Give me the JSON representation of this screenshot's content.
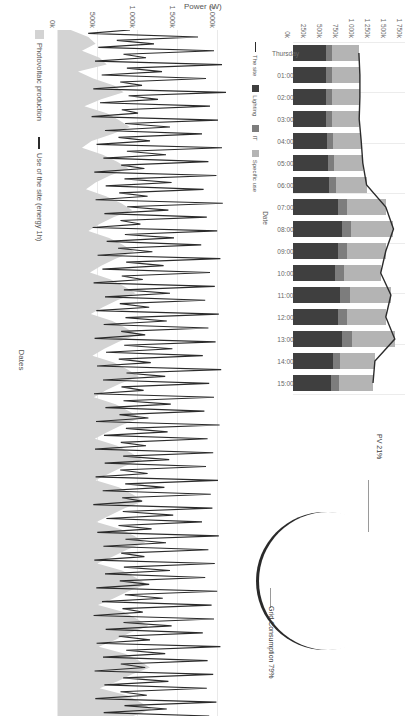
{
  "charts": {
    "timeseries": {
      "title": "",
      "ylabel": "Power (W)",
      "xlabel": "Dates",
      "yticks": [
        "0k",
        "500k",
        "1 000k",
        "1 500k",
        "2 000k"
      ],
      "legend": [
        {
          "label": "Photovoltaic production",
          "marker": "area-swatch",
          "color": "#d3d3d3"
        },
        {
          "label": "Use of the site (energy 1h)",
          "marker": "line-swatch",
          "color": "#2b2b2b"
        }
      ]
    },
    "stacked_bars": {
      "ylabel": "",
      "xlabel": "Date",
      "yticks": [
        "0k",
        "250k",
        "500k",
        "750k",
        "1 000k",
        "1 250k",
        "1 500k",
        "1 750k"
      ],
      "xticks": [
        "Thursday",
        "01:00",
        "02:00",
        "03:00",
        "04:00",
        "05:00",
        "06:00",
        "07:00",
        "08:00",
        "09:00",
        "10:00",
        "11:00",
        "12:00",
        "13:00",
        "14:00",
        "15:00"
      ],
      "legend": [
        {
          "label": "The site",
          "marker": "line-swatch",
          "color": "#2b2b2b"
        },
        {
          "label": "Lighting",
          "marker": "box-swatch",
          "color": "#3f3f3f"
        },
        {
          "label": "IT",
          "marker": "box-swatch",
          "color": "#7d7d7d"
        },
        {
          "label": "Specific use",
          "marker": "box-swatch",
          "color": "#b4b4b4"
        }
      ]
    },
    "pie": {
      "labels": [
        "PV 21%",
        "Grid Consumption 79%"
      ],
      "slices": [
        {
          "name": "PV 21%",
          "value": 21,
          "color": "#ececec"
        },
        {
          "name": "Grid Consumption 79%",
          "value": 79,
          "color": "#3a3a3a"
        }
      ]
    }
  },
  "chart_data": [
    {
      "type": "area",
      "title": "",
      "xlabel": "Dates",
      "ylabel": "Power (W)",
      "ylim": [
        0,
        2200000
      ],
      "yticks": [
        0,
        500000,
        1000000,
        1500000,
        2000000
      ],
      "ytick_labels": [
        "0k",
        "500k",
        "1 000k",
        "1 500k",
        "2 000k"
      ],
      "grid": true,
      "legend_position": "bottom-left",
      "series": [
        {
          "name": "Photovoltaic production",
          "color": "#d3d3d3",
          "kind": "area",
          "values": [
            160000,
            380000,
            470000,
            300000,
            520000,
            610000,
            250000,
            440000,
            700000,
            820000,
            540000,
            330000,
            610000,
            760000,
            900000,
            680000,
            420000,
            300000,
            560000,
            740000,
            880000,
            650000,
            470000,
            350000,
            600000,
            790000,
            930000,
            700000,
            520000,
            380000,
            640000,
            810000,
            950000,
            720000,
            540000,
            400000,
            660000,
            830000,
            970000,
            740000,
            560000,
            410000,
            680000,
            850000,
            990000,
            760000,
            580000,
            430000,
            700000,
            870000,
            1010000,
            780000,
            600000,
            450000,
            720000,
            890000,
            1030000,
            800000,
            620000,
            460000,
            740000,
            910000,
            1050000,
            820000,
            640000,
            470000,
            760000,
            930000,
            1070000,
            840000,
            660000,
            480000,
            780000,
            950000,
            1090000,
            860000,
            680000,
            490000,
            800000,
            970000,
            1110000,
            880000,
            700000,
            500000,
            820000,
            990000,
            1130000,
            900000,
            720000,
            510000,
            840000,
            1010000,
            1150000,
            920000,
            740000,
            520000,
            860000,
            1030000,
            1170000,
            940000
          ]
        },
        {
          "name": "Use of the site (energy 1h)",
          "color": "#2b2b2b",
          "kind": "line",
          "values": [
            900000,
            1750000,
            1200000,
            1950000,
            1100000,
            2050000,
            1300000,
            1850000,
            1050000,
            2100000,
            1250000,
            1900000,
            1000000,
            2000000,
            1400000,
            1800000,
            1150000,
            2050000,
            1350000,
            1880000,
            1080000,
            1980000,
            1420000,
            1820000,
            1120000,
            2060000,
            1380000,
            1860000,
            1030000,
            1990000,
            1450000,
            1790000,
            1180000,
            2030000,
            1320000,
            1900000,
            1060000,
            1960000,
            1400000,
            1840000,
            1140000,
            2010000,
            1360000,
            1880000,
            1090000,
            1970000,
            1430000,
            1810000,
            1160000,
            2040000,
            1340000,
            1890000,
            1070000,
            1950000,
            1410000,
            1830000,
            1130000,
            2020000,
            1370000,
            1870000,
            1100000,
            1940000,
            1390000,
            1850000,
            1120000,
            2000000,
            1330000,
            1910000,
            1050000,
            1930000,
            1440000,
            1800000,
            1170000,
            2010000,
            1350000,
            1880000,
            1080000,
            1960000,
            1400000,
            1840000,
            1140000,
            1990000,
            1310000,
            1920000,
            1060000,
            1950000,
            1420000,
            1810000,
            1150000,
            2030000,
            1340000,
            1870000,
            1090000,
            1940000,
            1380000,
            1860000,
            1110000,
            1980000,
            1360000,
            1890000
          ]
        }
      ]
    },
    {
      "type": "bar",
      "stacked": true,
      "title": "",
      "xlabel": "Date",
      "ylabel": "",
      "ylim": [
        0,
        1750000
      ],
      "yticks": [
        0,
        250000,
        500000,
        750000,
        1000000,
        1250000,
        1500000,
        1750000
      ],
      "ytick_labels": [
        "0k",
        "250k",
        "500k",
        "750k",
        "1 000k",
        "1 250k",
        "1 500k",
        "1 750k"
      ],
      "categories": [
        "Thursday",
        "01:00",
        "02:00",
        "03:00",
        "04:00",
        "05:00",
        "06:00",
        "07:00",
        "08:00",
        "09:00",
        "10:00",
        "11:00",
        "12:00",
        "13:00",
        "14:00",
        "15:00"
      ],
      "grid": true,
      "legend_position": "bottom",
      "series": [
        {
          "name": "Lighting",
          "color": "#3f3f3f",
          "values": [
            520000,
            520000,
            520000,
            520000,
            530000,
            540000,
            560000,
            700000,
            760000,
            700000,
            660000,
            740000,
            700000,
            770000,
            620000,
            600000
          ]
        },
        {
          "name": "IT",
          "color": "#7d7d7d",
          "values": [
            90000,
            95000,
            95000,
            90000,
            95000,
            100000,
            110000,
            140000,
            150000,
            140000,
            130000,
            150000,
            140000,
            150000,
            120000,
            120000
          ]
        },
        {
          "name": "Specific use",
          "color": "#b4b4b4",
          "values": [
            420000,
            430000,
            430000,
            425000,
            440000,
            450000,
            480000,
            610000,
            660000,
            610000,
            580000,
            640000,
            610000,
            670000,
            540000,
            530000
          ]
        }
      ],
      "line_series": [
        {
          "name": "The site",
          "color": "#2b2b2b",
          "values": [
            1030000,
            1045000,
            1045000,
            1035000,
            1065000,
            1090000,
            1150000,
            1450000,
            1570000,
            1450000,
            1370000,
            1530000,
            1450000,
            1590000,
            1280000,
            1250000
          ]
        }
      ]
    },
    {
      "type": "pie",
      "title": "",
      "labels": [
        "PV 21%",
        "Grid Consumption 79%"
      ],
      "values": [
        21,
        79
      ],
      "colors": [
        "#ececec",
        "#3a3a3a"
      ],
      "legend_position": "callout-labels"
    }
  ]
}
